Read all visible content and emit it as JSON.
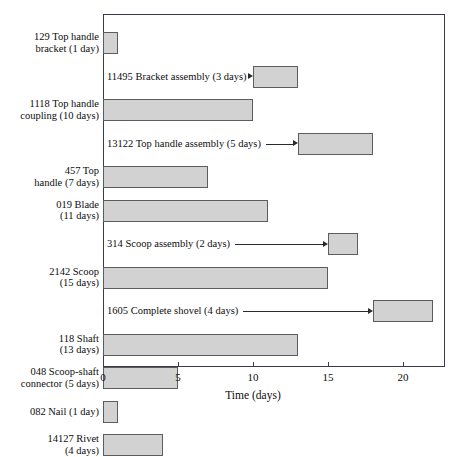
{
  "chart_data": {
    "type": "bar",
    "subtype": "gantt",
    "title": "",
    "xlabel": "Time (days)",
    "ylabel": "",
    "xlim": [
      0,
      22.8
    ],
    "xticks": [
      0,
      5,
      10,
      15,
      20
    ],
    "xticklabels": [
      "0",
      "5",
      "10",
      "15",
      "20"
    ],
    "grid": false,
    "legend": null,
    "bar_fill_color": "#d2d2d2",
    "bar_edge_color": "#5c5c5c",
    "frame_color": "#3a3a52",
    "rows": [
      {
        "kind": "task",
        "label": "129 Top handle\nbracket (1 day)",
        "part_number": "129",
        "name": "Top handle bracket",
        "duration": 1,
        "start": 0,
        "end": 1
      },
      {
        "kind": "assembly",
        "label": "11495 Bracket assembly (3 days)",
        "part_number": "11495",
        "name": "Bracket assembly",
        "duration": 3,
        "start": 10,
        "end": 13
      },
      {
        "kind": "task",
        "label": "1118 Top handle\ncoupling (10 days)",
        "part_number": "1118",
        "name": "Top handle coupling",
        "duration": 10,
        "start": 0,
        "end": 10
      },
      {
        "kind": "assembly",
        "label": "13122 Top handle assembly (5 days)",
        "part_number": "13122",
        "name": "Top handle assembly",
        "duration": 5,
        "start": 13,
        "end": 18
      },
      {
        "kind": "task",
        "label": "457 Top\nhandle (7 days)",
        "part_number": "457",
        "name": "Top handle",
        "duration": 7,
        "start": 0,
        "end": 7
      },
      {
        "kind": "task",
        "label": "019 Blade\n(11 days)",
        "part_number": "019",
        "name": "Blade",
        "duration": 11,
        "start": 0,
        "end": 11
      },
      {
        "kind": "assembly",
        "label": "314 Scoop assembly (2 days)",
        "part_number": "314",
        "name": "Scoop assembly",
        "duration": 2,
        "start": 15,
        "end": 17
      },
      {
        "kind": "task",
        "label": "2142 Scoop\n(15 days)",
        "part_number": "2142",
        "name": "Scoop",
        "duration": 15,
        "start": 0,
        "end": 15
      },
      {
        "kind": "assembly",
        "label": "1605 Complete shovel (4 days)",
        "part_number": "1605",
        "name": "Complete shovel",
        "duration": 4,
        "start": 18,
        "end": 22
      },
      {
        "kind": "task",
        "label": "118 Shaft\n(13 days)",
        "part_number": "118",
        "name": "Shaft",
        "duration": 13,
        "start": 0,
        "end": 13
      },
      {
        "kind": "task",
        "label": "048 Scoop-shaft\nconnector (5 days)",
        "part_number": "048",
        "name": "Scoop-shaft connector",
        "duration": 5,
        "start": 0,
        "end": 5
      },
      {
        "kind": "task",
        "label": "082 Nail (1 day)",
        "part_number": "082",
        "name": "Nail",
        "duration": 1,
        "start": 0,
        "end": 1
      },
      {
        "kind": "task",
        "label": "14127 Rivet\n(4 days)",
        "part_number": "14127",
        "name": "Rivet",
        "duration": 4,
        "start": 0,
        "end": 4
      }
    ]
  }
}
